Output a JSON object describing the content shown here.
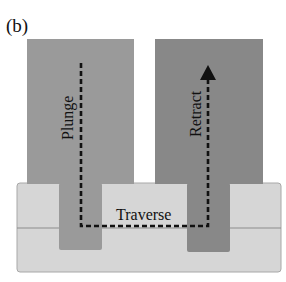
{
  "figure": {
    "panel_label": "(b)",
    "labels": {
      "plunge": "Plunge",
      "retract": "Retract",
      "traverse": "Traverse"
    },
    "colors": {
      "left_tool": "#9a9a9a",
      "right_tool": "#8a8a8a",
      "substrate": "#d6d6d6",
      "substrate_edge": "#9c9c9c",
      "path": "#111111",
      "text": "#111111"
    }
  }
}
